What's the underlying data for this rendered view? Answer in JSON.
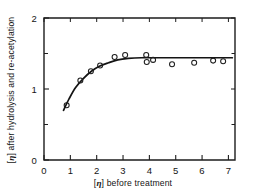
{
  "chart_data": {
    "type": "scatter",
    "title": "",
    "xlabel": "[η] before treatment",
    "ylabel": "[η] after hydrolysis and re-acetylation",
    "xlim": [
      0,
      7.25
    ],
    "ylim": [
      0,
      2
    ],
    "grid": false,
    "legend": null,
    "xticks": [
      0,
      1,
      2,
      3,
      4,
      5,
      6,
      7
    ],
    "xtick_labels": [
      "0",
      "1",
      "2",
      "3",
      "4",
      "5",
      "6",
      "7"
    ],
    "yticks": [
      0,
      1,
      2
    ],
    "ytick_labels": [
      "0",
      "1",
      "2"
    ],
    "yticks_minor": [
      0.5,
      1.5
    ],
    "marker": "open-circle",
    "points": [
      {
        "x": 0.86,
        "y": 0.77
      },
      {
        "x": 1.38,
        "y": 1.12
      },
      {
        "x": 1.78,
        "y": 1.25
      },
      {
        "x": 2.13,
        "y": 1.33
      },
      {
        "x": 2.68,
        "y": 1.45
      },
      {
        "x": 3.08,
        "y": 1.48
      },
      {
        "x": 3.88,
        "y": 1.48
      },
      {
        "x": 3.9,
        "y": 1.38
      },
      {
        "x": 4.14,
        "y": 1.41
      },
      {
        "x": 4.86,
        "y": 1.35
      },
      {
        "x": 5.7,
        "y": 1.37
      },
      {
        "x": 6.42,
        "y": 1.4
      },
      {
        "x": 6.8,
        "y": 1.39
      }
    ],
    "fit_curve": {
      "description": "saturating curve rising from 0.70 at x=0.74 to plateau near 1.44",
      "x_start": 0.74,
      "x_end": 7.15,
      "plateau": 1.44,
      "points": [
        {
          "x": 0.74,
          "y": 0.7
        },
        {
          "x": 0.95,
          "y": 0.86
        },
        {
          "x": 1.2,
          "y": 1.02
        },
        {
          "x": 1.5,
          "y": 1.15
        },
        {
          "x": 1.8,
          "y": 1.25
        },
        {
          "x": 2.1,
          "y": 1.32
        },
        {
          "x": 2.45,
          "y": 1.37
        },
        {
          "x": 2.8,
          "y": 1.41
        },
        {
          "x": 3.2,
          "y": 1.43
        },
        {
          "x": 3.7,
          "y": 1.44
        },
        {
          "x": 4.3,
          "y": 1.44
        },
        {
          "x": 5.2,
          "y": 1.44
        },
        {
          "x": 6.2,
          "y": 1.44
        },
        {
          "x": 7.15,
          "y": 1.44
        }
      ]
    },
    "colors": {
      "axis": "#1d1d1d",
      "marker": "#1d1d1d",
      "curve": "#141414",
      "background": "#ffffff"
    }
  },
  "axes": {
    "x_label_prefix": "[",
    "x_label_symbol": "η",
    "x_label_suffix": "] before treatment",
    "y_label_prefix": "[",
    "y_label_symbol": "η",
    "y_label_suffix": "] after hydrolysis and re-acetylation"
  }
}
